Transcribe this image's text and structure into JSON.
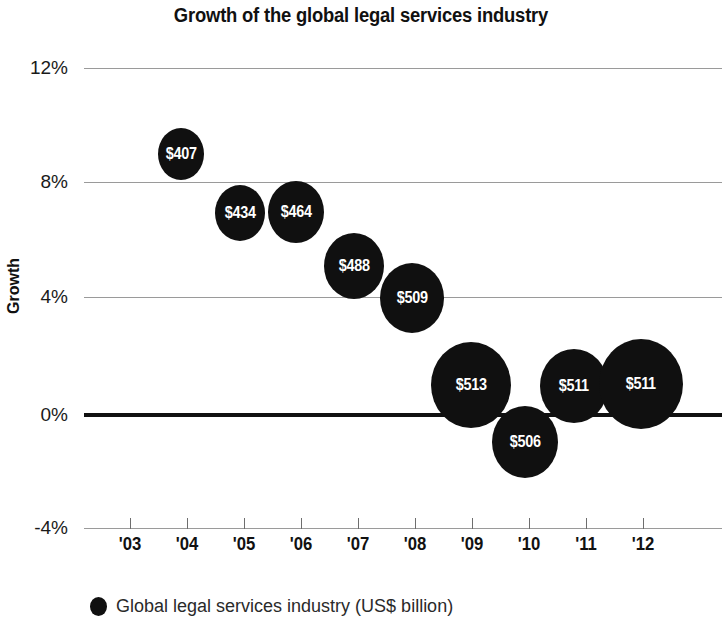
{
  "chart_data": {
    "type": "scatter",
    "title": "Growth of the global legal services industry",
    "xlabel": "",
    "ylabel": "Growth",
    "ylim": [
      -4,
      12
    ],
    "grid": true,
    "legend_position": "bottom-left",
    "legend": [
      "Global legal services industry (US$ billion)"
    ],
    "x_tick_labels": [
      "'03",
      "'04",
      "'05",
      "'06",
      "'07",
      "'08",
      "'09",
      "'10",
      "'11",
      "'12"
    ],
    "y_tick_labels": [
      "12%",
      "8%",
      "4%",
      "0%",
      "-4%"
    ],
    "y_tick_values": [
      12,
      8,
      4,
      0,
      -4
    ],
    "categories": [
      "2003",
      "2004",
      "2005",
      "2006",
      "2007",
      "2008",
      "2009",
      "2010",
      "2011",
      "2012"
    ],
    "series": [
      {
        "name": "Global legal services industry (US$ billion)",
        "color": "#101010",
        "points": [
          {
            "year": "2004",
            "x": 2004,
            "growth": 9.0,
            "size": 407,
            "label": "$407"
          },
          {
            "year": "2005",
            "x": 2005,
            "growth": 7.0,
            "size": 434,
            "label": "$434"
          },
          {
            "year": "2006",
            "x": 2006,
            "growth": 7.0,
            "size": 464,
            "label": "$464"
          },
          {
            "year": "2007",
            "x": 2007,
            "growth": 5.2,
            "size": 488,
            "label": "$488"
          },
          {
            "year": "2008",
            "x": 2008,
            "growth": 4.0,
            "size": 509,
            "label": "$509"
          },
          {
            "year": "2009",
            "x": 2009,
            "growth": 1.0,
            "size": 513,
            "label": "$513"
          },
          {
            "year": "2010",
            "x": 2010,
            "growth": -1.0,
            "size": 506,
            "label": "$506"
          },
          {
            "year": "2011",
            "x": 2011,
            "growth": 0.9,
            "size": 511,
            "label": "$511"
          },
          {
            "year": "2012",
            "x": 2012,
            "growth": 1.0,
            "size": 511,
            "label": "$511"
          }
        ]
      }
    ]
  },
  "render": {
    "bubbles": [
      {
        "label": "$407",
        "cx": 181,
        "cy": 154,
        "rx": 23,
        "ry": 26
      },
      {
        "label": "$434",
        "cx": 240,
        "cy": 213,
        "rx": 25,
        "ry": 28
      },
      {
        "label": "$464",
        "cx": 296,
        "cy": 212,
        "rx": 28,
        "ry": 31
      },
      {
        "label": "$488",
        "cx": 354,
        "cy": 266,
        "rx": 30,
        "ry": 33
      },
      {
        "label": "$509",
        "cx": 412,
        "cy": 298,
        "rx": 32,
        "ry": 35
      },
      {
        "label": "$513",
        "cx": 471,
        "cy": 385,
        "rx": 40,
        "ry": 43
      },
      {
        "label": "$506",
        "cx": 525,
        "cy": 442,
        "rx": 33,
        "ry": 36
      },
      {
        "label": "$511",
        "cx": 574,
        "cy": 386,
        "rx": 34,
        "ry": 37
      },
      {
        "label": "$511",
        "cx": 641,
        "cy": 384,
        "rx": 42,
        "ry": 45
      }
    ],
    "gridlines": [
      {
        "label": "12%",
        "y": 0,
        "zero": false
      },
      {
        "label": "8%",
        "y": 114,
        "zero": false
      },
      {
        "label": "4%",
        "y": 229,
        "zero": false
      },
      {
        "label": "0%",
        "y": 345,
        "zero": true
      },
      {
        "label": "-4%",
        "y": 460,
        "zero": false
      }
    ],
    "xticks": [
      {
        "label": "'03",
        "x": 130
      },
      {
        "label": "'04",
        "x": 187
      },
      {
        "label": "'05",
        "x": 244
      },
      {
        "label": "'06",
        "x": 301
      },
      {
        "label": "'07",
        "x": 358
      },
      {
        "label": "'08",
        "x": 415
      },
      {
        "label": "'09",
        "x": 472
      },
      {
        "label": "'10",
        "x": 529
      },
      {
        "label": "'11",
        "x": 586
      },
      {
        "label": "'12",
        "x": 643
      }
    ]
  },
  "legend": {
    "marker": "filled-circle",
    "text": "Global legal services industry (US$ billion)"
  }
}
